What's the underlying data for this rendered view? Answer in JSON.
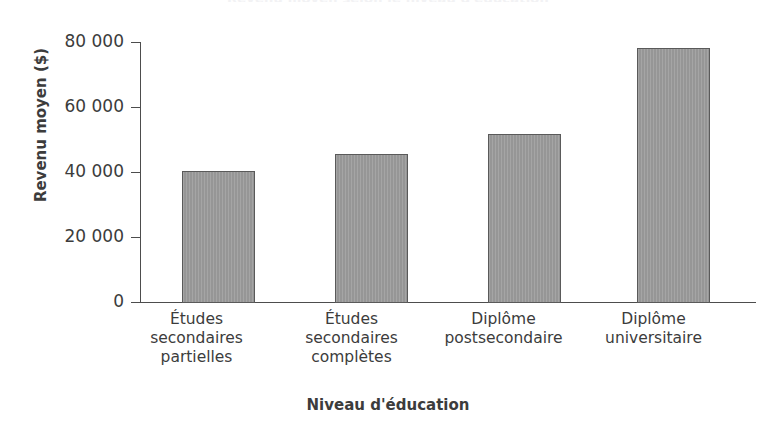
{
  "chart_data": {
    "type": "bar",
    "title": "Revenu moyen selon le niveau d'éducation",
    "xlabel": "Niveau d'éducation",
    "ylabel": "Revenu moyen ($)",
    "categories": [
      "Études\nsecondaires\npartielles",
      "Études\nsecondaires\ncomplètes",
      "Diplôme\npostsecondaire",
      "Diplôme\nuniversitaire"
    ],
    "values": [
      40500,
      46000,
      52000,
      78500
    ],
    "ylim": [
      0,
      80000
    ],
    "yticks": [
      0,
      20000,
      40000,
      60000,
      80000
    ],
    "ytick_labels": [
      "0",
      "20 000",
      "40 000",
      "60 000",
      "80 000"
    ],
    "grid": false,
    "legend": false,
    "bar_color": "#9b9b9b",
    "bar_edge_color": "#5a5a5a",
    "axis_color": "#4d4d4d",
    "text_color": "#3c3c3c",
    "background": "#ffffff"
  }
}
